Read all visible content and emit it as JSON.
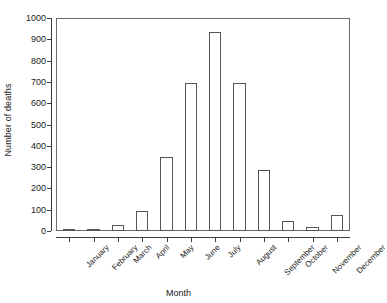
{
  "chart_data": {
    "type": "bar",
    "title": "",
    "xlabel": "Month",
    "ylabel": "Number of deaths",
    "categories": [
      "January",
      "February",
      "March",
      "April",
      "May",
      "June",
      "July",
      "August",
      "September",
      "October",
      "November",
      "December"
    ],
    "values": [
      5,
      5,
      30,
      95,
      350,
      700,
      940,
      700,
      290,
      45,
      18,
      75
    ],
    "ylim": [
      0,
      1000
    ],
    "yticks": [
      0,
      100,
      200,
      300,
      400,
      500,
      600,
      700,
      800,
      900,
      1000
    ],
    "ytick_labels": [
      "0",
      "100",
      "200",
      "300",
      "400",
      "500",
      "600",
      "700",
      "800",
      "900",
      "1000"
    ],
    "grid": false,
    "legend": null,
    "bar_fill_color": "#ffffff",
    "bar_edge_color": "#555555",
    "axis_color": "#3c3c3c",
    "background_color": "#ffffff"
  }
}
